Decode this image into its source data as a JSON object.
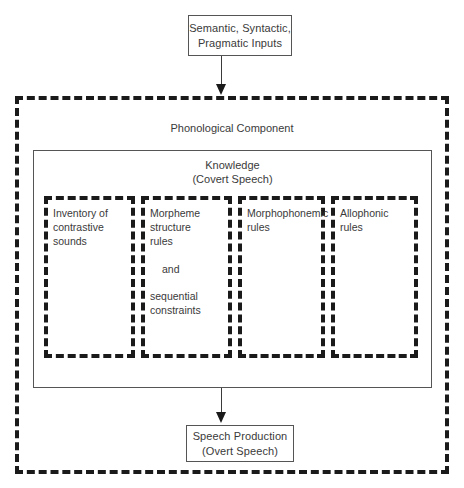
{
  "diagram": {
    "colors": {
      "background": "#ffffff",
      "text": "#3a3a3a",
      "solid_border": "#555555",
      "dashed_border": "#1a1a1a",
      "arrow": "#1a1a1a"
    },
    "input_box": {
      "label": "Semantic, Syntactic,\nPragmatic Inputs",
      "line1": "Semantic, Syntactic,",
      "line2": "Pragmatic Inputs"
    },
    "phonological_component": {
      "label": "Phonological Component"
    },
    "knowledge": {
      "line1": "Knowledge",
      "line2": "(Covert Speech)"
    },
    "components": [
      {
        "name": "inventory-of-contrastive-sounds",
        "text": "Inventory of\ncontrastive\nsounds"
      },
      {
        "name": "morpheme-structure-rules",
        "text": "Morpheme\nstructure\nrules",
        "connector": "and",
        "text2": "sequential\nconstraints"
      },
      {
        "name": "morphophonemic-rules",
        "text": "Morphophonemic\nrules"
      },
      {
        "name": "allophonic-rules",
        "text": "Allophonic\nrules"
      }
    ],
    "output_box": {
      "line1": "Speech Production",
      "line2": "(Overt Speech)"
    }
  }
}
